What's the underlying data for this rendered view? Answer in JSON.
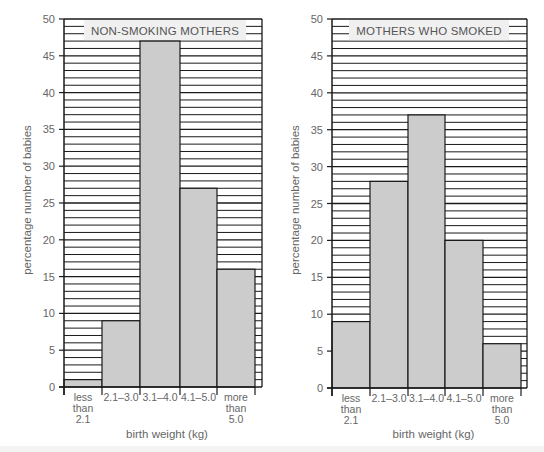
{
  "chart_data": [
    {
      "type": "bar",
      "title": "NON-SMOKING MOTHERS",
      "xlabel": "birth weight (kg)",
      "ylabel": "percentage number of babies",
      "categories": [
        "less than 2.1",
        "2.1–3.0",
        "3.1–4.0",
        "4.1–5.0",
        "more than 5.0"
      ],
      "category_lines": [
        [
          "less",
          "than",
          "2.1"
        ],
        [
          "2.1–3.0"
        ],
        [
          "3.1–4.0"
        ],
        [
          "4.1–5.0"
        ],
        [
          "more",
          "than",
          "5.0"
        ]
      ],
      "values": [
        1,
        9,
        47,
        27,
        16
      ],
      "ylim": [
        0,
        50
      ],
      "yticks": [
        0,
        5,
        10,
        15,
        20,
        25,
        30,
        35,
        40,
        45,
        50
      ],
      "grid": "horizontal lines every 1%",
      "legend": "none"
    },
    {
      "type": "bar",
      "title": "MOTHERS WHO SMOKED",
      "xlabel": "birth weight (kg)",
      "ylabel": "percentage number of babies",
      "categories": [
        "less than 2.1",
        "2.1–3.0",
        "3.1–4.0",
        "4.1–5.0",
        "more than 5.0"
      ],
      "category_lines": [
        [
          "less",
          "than",
          "2.1"
        ],
        [
          "2.1–3.0"
        ],
        [
          "3.1–4.0"
        ],
        [
          "4.1–5.0"
        ],
        [
          "more",
          "than",
          "5.0"
        ]
      ],
      "values": [
        9,
        28,
        37,
        20,
        6
      ],
      "ylim": [
        0,
        50
      ],
      "yticks": [
        0,
        5,
        10,
        15,
        20,
        25,
        30,
        35,
        40,
        45,
        50
      ],
      "grid": "horizontal lines every 1%",
      "legend": "none"
    }
  ],
  "colors": {
    "bar_fill": "#cccccc",
    "line": "#1a1a1a",
    "title_box": "#f0f0f0",
    "background": "#ffffff"
  }
}
